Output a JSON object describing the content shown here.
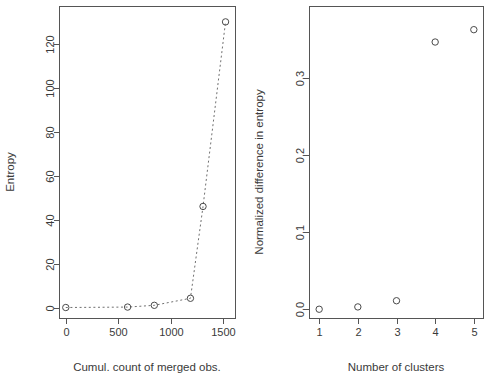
{
  "figure": {
    "background": "#ffffff",
    "width": 490,
    "height": 380,
    "panel_count": 2
  },
  "chart_data": [
    {
      "id": "entropy-vs-merged-obs",
      "type": "line",
      "title": "",
      "xlabel": "Cumul. count of merged obs.",
      "ylabel": "Entropy",
      "xlim": [
        -60,
        1620
      ],
      "ylim": [
        -5,
        137
      ],
      "xticks": [
        0,
        500,
        1000,
        1500
      ],
      "xtick_labels": [
        "0",
        "500",
        "1000",
        "1500"
      ],
      "yticks": [
        0,
        20,
        40,
        60,
        80,
        100,
        120
      ],
      "ytick_labels": [
        "0",
        "20",
        "40",
        "60",
        "80",
        "100",
        "120"
      ],
      "grid": false,
      "legend": "none",
      "marker": "open-circle",
      "linestyle": "dotted",
      "line_color": "#707070",
      "marker_color": "#4a4a4a",
      "x": [
        0,
        590,
        845,
        1190,
        1310,
        1525
      ],
      "y": [
        0,
        0.2,
        1.0,
        4.2,
        46,
        130
      ],
      "points": [
        {
          "x": 0,
          "y": 0
        },
        {
          "x": 590,
          "y": 0.2
        },
        {
          "x": 845,
          "y": 1.0
        },
        {
          "x": 1190,
          "y": 4.2
        },
        {
          "x": 1310,
          "y": 46
        },
        {
          "x": 1525,
          "y": 130
        }
      ]
    },
    {
      "id": "normalized-difference-vs-clusters",
      "type": "scatter",
      "title": "",
      "xlabel": "Number of clusters",
      "ylabel": "Normalized difference in entropy",
      "xlim": [
        0.75,
        5.25
      ],
      "ylim": [
        -0.012,
        0.392
      ],
      "xticks": [
        1,
        2,
        3,
        4,
        5
      ],
      "xtick_labels": [
        "1",
        "2",
        "3",
        "4",
        "5"
      ],
      "yticks": [
        0.0,
        0.1,
        0.2,
        0.3
      ],
      "ytick_labels": [
        "0.0",
        "0.1",
        "0.2",
        "0.3"
      ],
      "grid": false,
      "legend": "none",
      "marker": "open-circle",
      "marker_color": "#4a4a4a",
      "x": [
        1,
        2,
        3,
        4,
        5
      ],
      "y": [
        0.0,
        0.003,
        0.011,
        0.346,
        0.362
      ],
      "points": [
        {
          "x": 1,
          "y": 0.0
        },
        {
          "x": 2,
          "y": 0.003
        },
        {
          "x": 3,
          "y": 0.011
        },
        {
          "x": 4,
          "y": 0.346
        },
        {
          "x": 5,
          "y": 0.362
        }
      ]
    }
  ]
}
